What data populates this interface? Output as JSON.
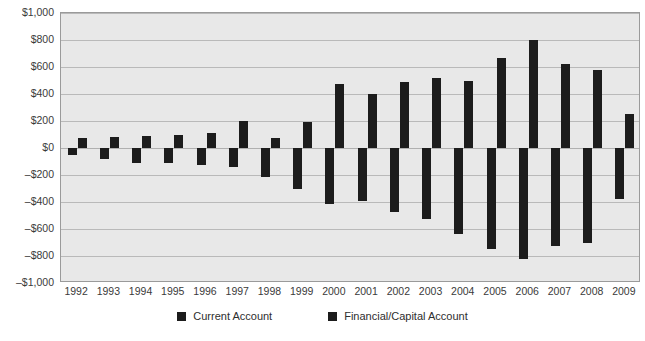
{
  "chart_data": {
    "type": "bar",
    "title": "",
    "subtitle": "",
    "xlabel": "",
    "ylabel": "",
    "ylim": [
      -1000,
      1000
    ],
    "ytick_step": 200,
    "grid": true,
    "legend_position": "bottom",
    "bar_color": "#1c1c1c",
    "plot_background": "#e8e8e8",
    "categories": [
      "1992",
      "1993",
      "1994",
      "1995",
      "1996",
      "1997",
      "1998",
      "1999",
      "2000",
      "2001",
      "2002",
      "2003",
      "2004",
      "2005",
      "2006",
      "2007",
      "2008",
      "2009"
    ],
    "ytick_labels": [
      "$1,000",
      "$800",
      "$600",
      "$400",
      "$200",
      "$0",
      "–$200",
      "–$400",
      "–$600",
      "–$800",
      "–$1,000"
    ],
    "ytick_values": [
      1000,
      800,
      600,
      400,
      200,
      0,
      -200,
      -400,
      -600,
      -800,
      -1000
    ],
    "series": [
      {
        "name": "Current Account",
        "values": [
          -50,
          -82,
          -110,
          -114,
          -125,
          -141,
          -215,
          -301,
          -417,
          -389,
          -472,
          -528,
          -640,
          -748,
          -825,
          -727,
          -706,
          -378
        ]
      },
      {
        "name": "Financial/Capital Account",
        "values": [
          72,
          78,
          90,
          96,
          108,
          198,
          75,
          190,
          477,
          400,
          492,
          520,
          500,
          668,
          800,
          622,
          578,
          250
        ]
      }
    ]
  },
  "legend": {
    "items": [
      {
        "label": "Current Account",
        "color": "#1c1c1c"
      },
      {
        "label": "Financial/Capital Account",
        "color": "#1c1c1c"
      }
    ]
  }
}
